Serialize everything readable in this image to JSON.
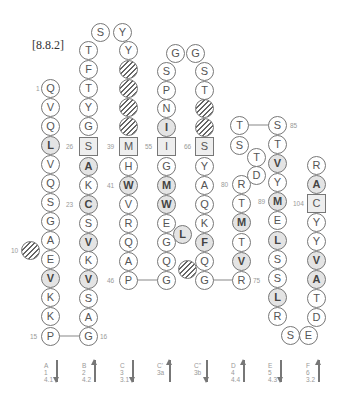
{
  "figure_label": "[8.8.2]",
  "residues": [
    {
      "id": "a1",
      "aa": "Q",
      "x": 50,
      "y": 88
    },
    {
      "id": "a2",
      "aa": "V",
      "x": 50,
      "y": 107
    },
    {
      "id": "a3",
      "aa": "Q",
      "x": 50,
      "y": 126
    },
    {
      "id": "a4",
      "aa": "L",
      "x": 50,
      "y": 145,
      "style": "bold"
    },
    {
      "id": "a5",
      "aa": "V",
      "x": 50,
      "y": 164
    },
    {
      "id": "a6",
      "aa": "Q",
      "x": 50,
      "y": 183
    },
    {
      "id": "a7",
      "aa": "S",
      "x": 50,
      "y": 202
    },
    {
      "id": "a8",
      "aa": "G",
      "x": 50,
      "y": 221
    },
    {
      "id": "a9",
      "aa": "A",
      "x": 50,
      "y": 240
    },
    {
      "id": "a10",
      "aa": "E",
      "x": 50,
      "y": 259
    },
    {
      "id": "a11",
      "aa": "V",
      "x": 50,
      "y": 278,
      "style": "bold"
    },
    {
      "id": "a12",
      "aa": "K",
      "x": 50,
      "y": 297
    },
    {
      "id": "a13",
      "aa": "K",
      "x": 50,
      "y": 316
    },
    {
      "id": "a14",
      "aa": "P",
      "x": 50,
      "y": 336
    },
    {
      "id": "h10",
      "aa": "",
      "x": 30,
      "y": 250,
      "style": "hatch"
    },
    {
      "id": "b1",
      "aa": "G",
      "x": 88,
      "y": 336
    },
    {
      "id": "b2",
      "aa": "A",
      "x": 88,
      "y": 317
    },
    {
      "id": "b3",
      "aa": "S",
      "x": 88,
      "y": 298
    },
    {
      "id": "b4",
      "aa": "V",
      "x": 88,
      "y": 279,
      "style": "bold"
    },
    {
      "id": "b5",
      "aa": "K",
      "x": 88,
      "y": 260
    },
    {
      "id": "b6",
      "aa": "V",
      "x": 88,
      "y": 242,
      "style": "bold"
    },
    {
      "id": "b7",
      "aa": "S",
      "x": 88,
      "y": 223
    },
    {
      "id": "b8",
      "aa": "C",
      "x": 88,
      "y": 204,
      "style": "bold"
    },
    {
      "id": "b9",
      "aa": "K",
      "x": 88,
      "y": 185
    },
    {
      "id": "b10",
      "aa": "A",
      "x": 88,
      "y": 166,
      "style": "bold"
    },
    {
      "id": "b11",
      "aa": "S",
      "x": 88,
      "y": 146,
      "style": "box"
    },
    {
      "id": "b12",
      "aa": "G",
      "x": 88,
      "y": 126
    },
    {
      "id": "b13",
      "aa": "Y",
      "x": 88,
      "y": 107
    },
    {
      "id": "b14",
      "aa": "T",
      "x": 88,
      "y": 88
    },
    {
      "id": "b15",
      "aa": "F",
      "x": 88,
      "y": 69
    },
    {
      "id": "b16",
      "aa": "T",
      "x": 88,
      "y": 50
    },
    {
      "id": "b17",
      "aa": "S",
      "x": 100,
      "y": 32
    },
    {
      "id": "b18",
      "aa": "Y",
      "x": 122,
      "y": 32
    },
    {
      "id": "c1",
      "aa": "Y",
      "x": 128,
      "y": 50
    },
    {
      "id": "c2",
      "aa": "",
      "x": 128,
      "y": 69,
      "style": "hatch"
    },
    {
      "id": "c3",
      "aa": "",
      "x": 128,
      "y": 88,
      "style": "hatch"
    },
    {
      "id": "c4",
      "aa": "",
      "x": 128,
      "y": 107,
      "style": "hatch"
    },
    {
      "id": "c5",
      "aa": "",
      "x": 128,
      "y": 126,
      "style": "hatch"
    },
    {
      "id": "c6",
      "aa": "M",
      "x": 128,
      "y": 146,
      "style": "box"
    },
    {
      "id": "c7",
      "aa": "H",
      "x": 128,
      "y": 166
    },
    {
      "id": "c8",
      "aa": "W",
      "x": 128,
      "y": 185,
      "style": "bold"
    },
    {
      "id": "c9",
      "aa": "V",
      "x": 128,
      "y": 204
    },
    {
      "id": "c10",
      "aa": "R",
      "x": 128,
      "y": 223
    },
    {
      "id": "c11",
      "aa": "Q",
      "x": 128,
      "y": 242
    },
    {
      "id": "c12",
      "aa": "A",
      "x": 128,
      "y": 261
    },
    {
      "id": "c13",
      "aa": "P",
      "x": 128,
      "y": 280
    },
    {
      "id": "d1",
      "aa": "G",
      "x": 166,
      "y": 280
    },
    {
      "id": "d2",
      "aa": "Q",
      "x": 166,
      "y": 261
    },
    {
      "id": "d3",
      "aa": "G",
      "x": 166,
      "y": 242
    },
    {
      "id": "d4",
      "aa": "E",
      "x": 166,
      "y": 223
    },
    {
      "id": "d5",
      "aa": "W",
      "x": 166,
      "y": 204,
      "style": "bold"
    },
    {
      "id": "d6",
      "aa": "M",
      "x": 166,
      "y": 185,
      "style": "bold"
    },
    {
      "id": "d7",
      "aa": "G",
      "x": 166,
      "y": 166
    },
    {
      "id": "d8",
      "aa": "I",
      "x": 166,
      "y": 146,
      "style": "box"
    },
    {
      "id": "d9",
      "aa": "I",
      "x": 166,
      "y": 127,
      "style": "bold"
    },
    {
      "id": "d10",
      "aa": "N",
      "x": 166,
      "y": 108
    },
    {
      "id": "d11",
      "aa": "P",
      "x": 166,
      "y": 90
    },
    {
      "id": "d12",
      "aa": "S",
      "x": 166,
      "y": 71
    },
    {
      "id": "d13",
      "aa": "G",
      "x": 175,
      "y": 53
    },
    {
      "id": "d14",
      "aa": "G",
      "x": 195,
      "y": 53
    },
    {
      "id": "dL",
      "aa": "L",
      "x": 182,
      "y": 234,
      "style": "bold"
    },
    {
      "id": "e1",
      "aa": "S",
      "x": 204,
      "y": 71
    },
    {
      "id": "e2",
      "aa": "T",
      "x": 204,
      "y": 90
    },
    {
      "id": "e3",
      "aa": "",
      "x": 204,
      "y": 108,
      "style": "hatch"
    },
    {
      "id": "e4",
      "aa": "",
      "x": 204,
      "y": 127,
      "style": "hatch"
    },
    {
      "id": "e5",
      "aa": "S",
      "x": 204,
      "y": 146,
      "style": "box"
    },
    {
      "id": "e6",
      "aa": "Y",
      "x": 204,
      "y": 166
    },
    {
      "id": "e7",
      "aa": "A",
      "x": 204,
      "y": 185
    },
    {
      "id": "e8",
      "aa": "Q",
      "x": 204,
      "y": 204
    },
    {
      "id": "e9",
      "aa": "K",
      "x": 204,
      "y": 223
    },
    {
      "id": "e10",
      "aa": "F",
      "x": 204,
      "y": 242,
      "style": "bold"
    },
    {
      "id": "e11",
      "aa": "Q",
      "x": 204,
      "y": 261
    },
    {
      "id": "e12",
      "aa": "G",
      "x": 204,
      "y": 280
    },
    {
      "id": "eH",
      "aa": "",
      "x": 187,
      "y": 269,
      "style": "hatch"
    },
    {
      "id": "f1",
      "aa": "R",
      "x": 241,
      "y": 280
    },
    {
      "id": "f2",
      "aa": "V",
      "x": 241,
      "y": 261,
      "style": "bold"
    },
    {
      "id": "f3",
      "aa": "T",
      "x": 241,
      "y": 242
    },
    {
      "id": "f4",
      "aa": "M",
      "x": 241,
      "y": 222,
      "style": "bold"
    },
    {
      "id": "f5",
      "aa": "T",
      "x": 241,
      "y": 203
    },
    {
      "id": "f6",
      "aa": "R",
      "x": 241,
      "y": 184
    },
    {
      "id": "f7",
      "aa": "D",
      "x": 256,
      "y": 175
    },
    {
      "id": "f8",
      "aa": "T",
      "x": 256,
      "y": 157
    },
    {
      "id": "f9",
      "aa": "S",
      "x": 239,
      "y": 145
    },
    {
      "id": "f10",
      "aa": "T",
      "x": 239,
      "y": 125
    },
    {
      "id": "g1",
      "aa": "S",
      "x": 277,
      "y": 125
    },
    {
      "id": "g2",
      "aa": "T",
      "x": 277,
      "y": 144
    },
    {
      "id": "g3",
      "aa": "V",
      "x": 277,
      "y": 163,
      "style": "bold"
    },
    {
      "id": "g4",
      "aa": "Y",
      "x": 277,
      "y": 182
    },
    {
      "id": "g5",
      "aa": "M",
      "x": 277,
      "y": 201,
      "style": "bold"
    },
    {
      "id": "g6",
      "aa": "E",
      "x": 277,
      "y": 220
    },
    {
      "id": "g7",
      "aa": "L",
      "x": 277,
      "y": 240,
      "style": "bold"
    },
    {
      "id": "g8",
      "aa": "S",
      "x": 277,
      "y": 259
    },
    {
      "id": "g9",
      "aa": "S",
      "x": 277,
      "y": 278
    },
    {
      "id": "g10",
      "aa": "L",
      "x": 277,
      "y": 297,
      "style": "bold"
    },
    {
      "id": "g11",
      "aa": "R",
      "x": 277,
      "y": 316
    },
    {
      "id": "g12",
      "aa": "S",
      "x": 290,
      "y": 335
    },
    {
      "id": "g13",
      "aa": "E",
      "x": 308,
      "y": 335
    },
    {
      "id": "h1",
      "aa": "D",
      "x": 316,
      "y": 317
    },
    {
      "id": "h2",
      "aa": "T",
      "x": 316,
      "y": 298
    },
    {
      "id": "h3",
      "aa": "A",
      "x": 316,
      "y": 279,
      "style": "bold"
    },
    {
      "id": "h4",
      "aa": "V",
      "x": 316,
      "y": 260,
      "style": "bold"
    },
    {
      "id": "h5",
      "aa": "Y",
      "x": 316,
      "y": 241
    },
    {
      "id": "h6",
      "aa": "Y",
      "x": 316,
      "y": 222
    },
    {
      "id": "h7",
      "aa": "C",
      "x": 316,
      "y": 203,
      "style": "box"
    },
    {
      "id": "h8",
      "aa": "A",
      "x": 316,
      "y": 184,
      "style": "bold"
    },
    {
      "id": "h9",
      "aa": "R",
      "x": 316,
      "y": 165
    }
  ],
  "residue_numbers": [
    {
      "text": "1",
      "x": 36,
      "y": 85
    },
    {
      "text": "10",
      "x": 11,
      "y": 247
    },
    {
      "text": "15",
      "x": 30,
      "y": 333
    },
    {
      "text": "16",
      "x": 100,
      "y": 333
    },
    {
      "text": "23",
      "x": 66,
      "y": 201
    },
    {
      "text": "26",
      "x": 66,
      "y": 143
    },
    {
      "text": "39",
      "x": 107,
      "y": 143
    },
    {
      "text": "41",
      "x": 107,
      "y": 182
    },
    {
      "text": "46",
      "x": 107,
      "y": 277
    },
    {
      "text": "55",
      "x": 145,
      "y": 143
    },
    {
      "text": "66",
      "x": 184,
      "y": 143
    },
    {
      "text": "80",
      "x": 221,
      "y": 181
    },
    {
      "text": "85",
      "x": 290,
      "y": 122
    },
    {
      "text": "89",
      "x": 258,
      "y": 198
    },
    {
      "text": "104",
      "x": 293,
      "y": 200
    },
    {
      "text": "75",
      "x": 253,
      "y": 277
    }
  ],
  "strands": [
    {
      "name": "A",
      "num": "1",
      "sub": "4.1",
      "dir": "down",
      "x": 44
    },
    {
      "name": "B",
      "num": "2",
      "sub": "4.2",
      "dir": "up",
      "x": 82
    },
    {
      "name": "C",
      "num": "3",
      "sub": "3.1",
      "dir": "down",
      "x": 120
    },
    {
      "name": "C'",
      "num": "3a",
      "sub": "",
      "dir": "up",
      "x": 157
    },
    {
      "name": "C\"",
      "num": "3b",
      "sub": "",
      "dir": "down",
      "x": 194
    },
    {
      "name": "D",
      "num": "4",
      "sub": "4.4",
      "dir": "up",
      "x": 231
    },
    {
      "name": "E",
      "num": "5",
      "sub": "4.3",
      "dir": "down",
      "x": 268
    },
    {
      "name": "F",
      "num": "6",
      "sub": "3.2",
      "dir": "up",
      "x": 306
    }
  ],
  "connectors": [
    {
      "x1": 50,
      "y1": 336,
      "x2": 88,
      "y2": 336
    },
    {
      "x1": 128,
      "y1": 280,
      "x2": 166,
      "y2": 280
    },
    {
      "x1": 204,
      "y1": 280,
      "x2": 241,
      "y2": 280
    },
    {
      "x1": 239,
      "y1": 125,
      "x2": 277,
      "y2": 125
    }
  ]
}
